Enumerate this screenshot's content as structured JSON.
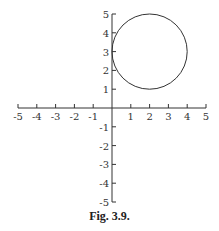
{
  "figure": {
    "caption": "Fig. 3.9.",
    "x_axis": {
      "min": -5,
      "max": 5,
      "ticks": [
        -5,
        -4,
        -3,
        -2,
        -1,
        1,
        2,
        3,
        4,
        5
      ]
    },
    "y_axis": {
      "min": -5,
      "max": 5,
      "ticks": [
        -5,
        -4,
        -3,
        -2,
        -1,
        1,
        2,
        3,
        4,
        5
      ]
    },
    "circle": {
      "center_x": 2,
      "center_y": 3,
      "radius": 2
    },
    "stroke_color": "#333333"
  }
}
